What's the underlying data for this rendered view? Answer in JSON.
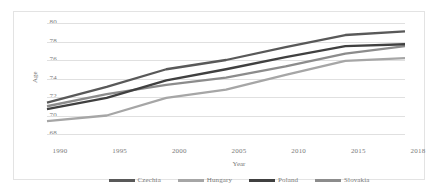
{
  "chart_data": {
    "type": "line",
    "title": "",
    "xlabel": "Year",
    "ylabel": "Age",
    "x": [
      1990,
      1995,
      2000,
      2005,
      2010,
      2015,
      2018
    ],
    "xtick_labels": [
      "1990",
      "1995",
      "2000",
      "2005",
      "2010",
      "2015",
      "2018"
    ],
    "ytick_labels": [
      "80",
      "78",
      "76",
      "74",
      "72",
      "70",
      "68"
    ],
    "ylim": [
      68,
      80
    ],
    "yticks": [
      68,
      70,
      72,
      74,
      76,
      78,
      80
    ],
    "grid": "horizontal",
    "legend_position": "bottom",
    "series": [
      {
        "name": "Czechia",
        "color": "#595959",
        "values": [
          71.4,
          73.1,
          75.0,
          76.0,
          77.4,
          78.7,
          79.1
        ]
      },
      {
        "name": "Hungary",
        "color": "#a6a6a6",
        "values": [
          69.4,
          70.0,
          71.9,
          72.8,
          74.4,
          75.9,
          76.2
        ]
      },
      {
        "name": "Poland",
        "color": "#404040",
        "values": [
          70.7,
          71.9,
          73.8,
          75.0,
          76.3,
          77.5,
          77.7
        ]
      },
      {
        "name": "Slovakia",
        "color": "#8c8c8c",
        "values": [
          71.0,
          72.3,
          73.3,
          74.1,
          75.3,
          76.7,
          77.5
        ]
      }
    ]
  },
  "axes": {
    "y_title": "Age",
    "x_title": "Year"
  },
  "legend": {
    "entries": [
      {
        "label": "Czechia"
      },
      {
        "label": "Hungary"
      },
      {
        "label": "Poland"
      },
      {
        "label": "Slovakia"
      }
    ]
  }
}
